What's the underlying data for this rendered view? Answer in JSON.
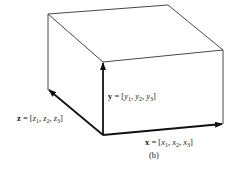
{
  "diagram": {
    "caption": "(b)",
    "vectors": {
      "x": {
        "name": "x",
        "eq": " = [",
        "c1": "x",
        "s1": "1",
        "c2": "x",
        "s2": "2",
        "c3": "x",
        "s3": "3",
        "close": "]"
      },
      "y": {
        "name": "y",
        "eq": " = [",
        "c1": "y",
        "s1": "1",
        "c2": "y",
        "s2": "2",
        "c3": "y",
        "s3": "3",
        "close": "]"
      },
      "z": {
        "name": "z",
        "eq": " = [",
        "c1": "z",
        "s1": "1",
        "c2": "z",
        "s2": "2",
        "c3": "z",
        "s3": "3",
        "close": "]"
      }
    },
    "colors": {
      "line": "#333333",
      "arrow": "#111111"
    }
  }
}
